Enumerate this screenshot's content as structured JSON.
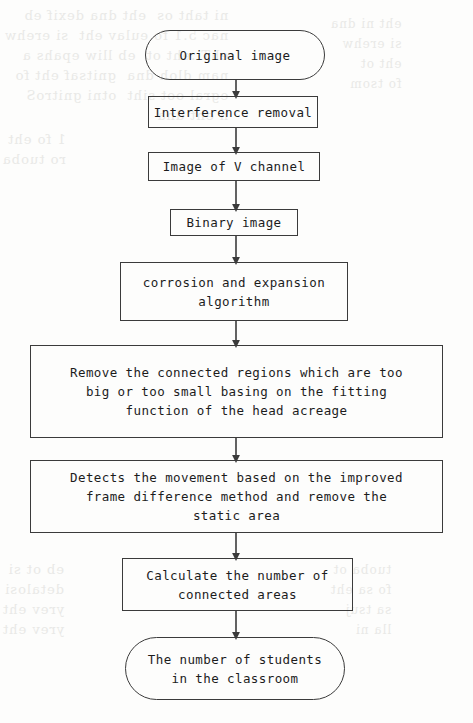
{
  "page": {
    "kind": "scanned-paper-flowchart",
    "background_color": "#fdfdfc",
    "line_color": "#3b3b3b",
    "text_color": "#1c1c1c"
  },
  "bleed_through": {
    "top_left": "ni taht os  eht dna dexif eb\nnac 5.1 fo eulav eht  si erehw\nehT .eht ot  eb lliw epahs a\nnam dloh dna  gnitsaf eht fo\negral oot siht  otni gnitroS\nn eht dna",
    "top_right": "eht ni dna\nsi erehw\neht ot\nfo tsom",
    "middle_left": "1 fo eht\nro tuoba",
    "bottom_left": "eb ot si\ndetalosi\nyrev eht\nyrev eht",
    "bottom_right": "tuoba ot\nfo sa eht\nsa tsuj\nlla ni"
  },
  "flowchart": {
    "type": "flowchart",
    "orientation": "vertical",
    "nodes": [
      {
        "id": "start",
        "shape": "terminator",
        "label": "Original image"
      },
      {
        "id": "interference",
        "shape": "process",
        "label": "Interference removal"
      },
      {
        "id": "vchannel",
        "shape": "process",
        "label": "Image of V channel"
      },
      {
        "id": "binary",
        "shape": "process",
        "label": "Binary image"
      },
      {
        "id": "morphology",
        "shape": "process",
        "label": "corrosion and expansion\nalgorithm"
      },
      {
        "id": "remove",
        "shape": "process",
        "label": "Remove the connected regions which are too\nbig or too small basing on the fitting\nfunction of the head acreage"
      },
      {
        "id": "motion",
        "shape": "process",
        "label": "Detects the movement based on the improved\nframe difference method and remove the\nstatic area"
      },
      {
        "id": "count",
        "shape": "process",
        "label": "Calculate the number of\nconnected areas"
      },
      {
        "id": "end",
        "shape": "terminator",
        "label": "The number of students\nin  the classroom"
      }
    ],
    "edges": [
      {
        "from": "start",
        "to": "interference"
      },
      {
        "from": "interference",
        "to": "vchannel"
      },
      {
        "from": "vchannel",
        "to": "binary"
      },
      {
        "from": "binary",
        "to": "morphology"
      },
      {
        "from": "morphology",
        "to": "remove"
      },
      {
        "from": "remove",
        "to": "motion"
      },
      {
        "from": "motion",
        "to": "count"
      },
      {
        "from": "count",
        "to": "end"
      }
    ]
  }
}
